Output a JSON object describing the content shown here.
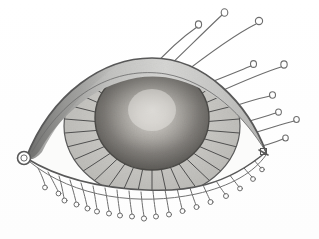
{
  "artwork": {
    "title": "Stylized Eye Drawing",
    "medium": "pencil-ink-sketch",
    "subject": "human eye, frontal view",
    "background_color": "#ffffff",
    "line_color": "#585858",
    "canvas": {
      "width": 319,
      "height": 239
    }
  },
  "palette": {
    "background": "#ffffff",
    "outline": "#585858",
    "outline_soft": "#7a7a7a",
    "lash_stroke": "#6d6d6d",
    "lid_shade_light": "#d8d8d6",
    "lid_shade_mid": "#b6b6b4",
    "lid_shade_dark": "#8e8e8c",
    "iris_center": "#e2e0dc",
    "iris_mid": "#9c9a96",
    "iris_edge": "#5e5c58",
    "ciliary_fill": "#c9c8c4",
    "sclera_fill": "#fbfbfa",
    "stripe_color": "#4f4f4f"
  },
  "anatomy": {
    "eye_outline": {
      "name": "almond eye aperture",
      "inner_corner_x": 26,
      "inner_corner_y": 158,
      "outer_corner_x": 266,
      "outer_corner_y": 152,
      "upper_lid_peak_y": 60,
      "lower_lid_trough_y": 188
    },
    "caruncle": {
      "name": "inner corner circle",
      "cx": 24,
      "cy": 158,
      "r": 6.5
    },
    "upper_lid_fold": {
      "name": "upper eyelid crease band",
      "shading": "graded from dark at inner corner to light at outer third"
    },
    "iris": {
      "name": "iris disc",
      "cx": 152,
      "cy": 118,
      "rx": 57,
      "ry": 52,
      "shading": "radial gradient, light center highlight to dark rim",
      "highlight_cx": 152,
      "highlight_cy": 110
    },
    "ciliary_ring": {
      "name": "radially striped ring around iris",
      "cx": 152,
      "cy": 126,
      "rx": 88,
      "ry": 72,
      "spoke_count": 34
    }
  },
  "lashes": {
    "upper": {
      "label": "Upper eyelashes",
      "count": 9,
      "style": "long sweeping curves, each terminating in a small open ring",
      "tip_shape": "open-circle",
      "tips": [
        {
          "x": 199,
          "y": 24
        },
        {
          "x": 225,
          "y": 12
        },
        {
          "x": 259,
          "y": 21
        },
        {
          "x": 253,
          "y": 64
        },
        {
          "x": 284,
          "y": 65
        },
        {
          "x": 272,
          "y": 96
        },
        {
          "x": 278,
          "y": 113
        },
        {
          "x": 297,
          "y": 120
        },
        {
          "x": 285,
          "y": 138
        }
      ]
    },
    "lower": {
      "label": "Lower eyelashes",
      "count": 17,
      "style": "short drooping strokes, each ending in a tiny circle",
      "tip_shape": "open-circle"
    }
  }
}
